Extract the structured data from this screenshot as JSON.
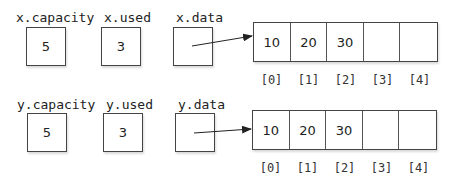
{
  "rows": [
    {
      "name": "x",
      "capacity_label": "x.capacity",
      "capacity_value": "5",
      "used_label": "x.used",
      "used_value": "3",
      "data_label": "x.data",
      "array": [
        "10",
        "20",
        "30",
        "",
        ""
      ],
      "indices": [
        "[0]",
        "[1]",
        "[2]",
        "[3]",
        "[4]"
      ]
    },
    {
      "name": "y",
      "capacity_label": "y.capacity",
      "capacity_value": "5",
      "used_label": "y.used",
      "used_value": "3",
      "data_label": "y.data",
      "array": [
        "10",
        "20",
        "30",
        "",
        ""
      ],
      "indices": [
        "[0]",
        "[1]",
        "[2]",
        "[3]",
        "[4]"
      ]
    }
  ]
}
